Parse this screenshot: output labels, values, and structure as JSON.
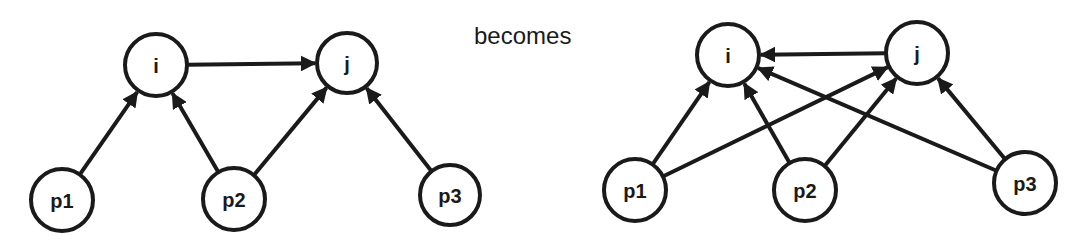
{
  "caption": "becomes",
  "left_graph": {
    "nodes": [
      {
        "id": "i",
        "label": "i",
        "x": 156,
        "y": 65,
        "r": 31
      },
      {
        "id": "j",
        "label": "j",
        "x": 347,
        "y": 63,
        "r": 30
      },
      {
        "id": "p1",
        "label": "p1",
        "x": 62,
        "y": 200,
        "r": 31
      },
      {
        "id": "p2",
        "label": "p2",
        "x": 234,
        "y": 199,
        "r": 31
      },
      {
        "id": "p3",
        "label": "p3",
        "x": 450,
        "y": 195,
        "r": 30
      }
    ],
    "edges": [
      {
        "from": "i",
        "to": "j"
      },
      {
        "from": "p1",
        "to": "i"
      },
      {
        "from": "p2",
        "to": "i"
      },
      {
        "from": "p2",
        "to": "j"
      },
      {
        "from": "p3",
        "to": "j"
      }
    ]
  },
  "right_graph": {
    "nodes": [
      {
        "id": "i",
        "label": "i",
        "x": 728,
        "y": 55,
        "r": 31
      },
      {
        "id": "j",
        "label": "j",
        "x": 917,
        "y": 53,
        "r": 31
      },
      {
        "id": "p1",
        "label": "p1",
        "x": 635,
        "y": 190,
        "r": 31
      },
      {
        "id": "p2",
        "label": "p2",
        "x": 805,
        "y": 190,
        "r": 31
      },
      {
        "id": "p3",
        "label": "p3",
        "x": 1025,
        "y": 183,
        "r": 31
      }
    ],
    "edges": [
      {
        "from": "j",
        "to": "i"
      },
      {
        "from": "p1",
        "to": "i"
      },
      {
        "from": "p1",
        "to": "j"
      },
      {
        "from": "p2",
        "to": "i"
      },
      {
        "from": "p2",
        "to": "j"
      },
      {
        "from": "p3",
        "to": "i"
      },
      {
        "from": "p3",
        "to": "j"
      }
    ]
  }
}
